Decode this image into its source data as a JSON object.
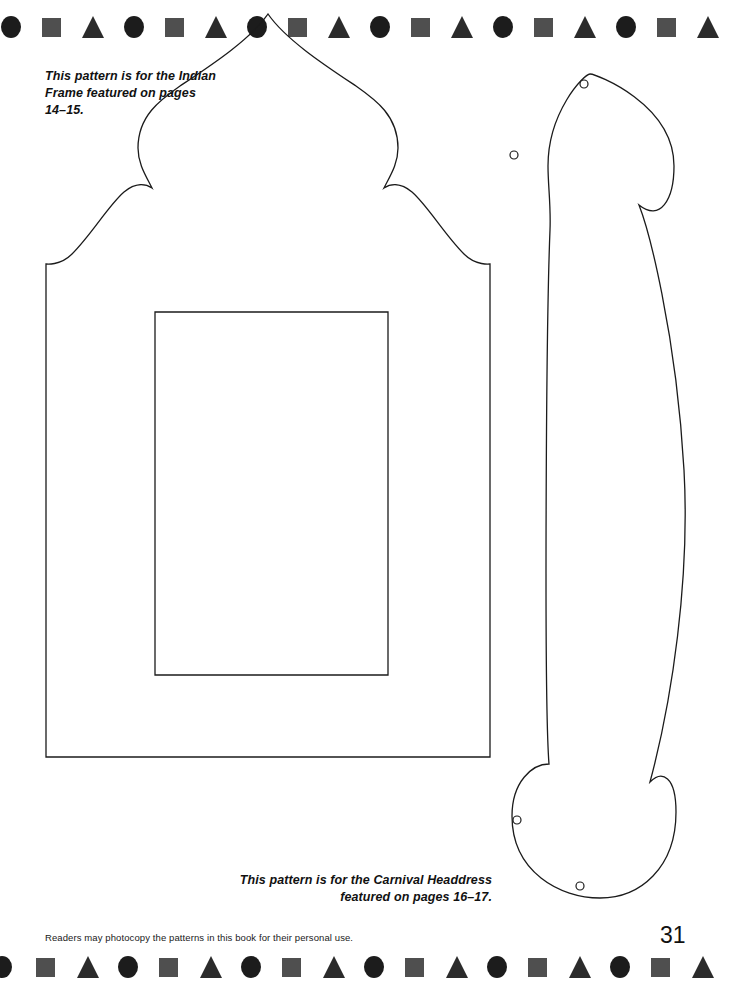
{
  "page": {
    "number": "31",
    "background_color": "#ffffff",
    "ink_color": "#1b1b1b",
    "width": 736,
    "height": 982
  },
  "captions": {
    "indian_frame": "This pattern is for the Indian\nFrame featured on pages\n14–15.",
    "carnival_headdress": "This pattern is for the Carnival Headdress\nfeatured on pages 16–17."
  },
  "footer": {
    "note": "Readers may photocopy the patterns in this book for their personal use."
  },
  "border": {
    "sequence": [
      "circle",
      "square",
      "triangle"
    ],
    "repeat_count": 18,
    "spacing_px": 41,
    "colors": {
      "circle": "#1c1c1c",
      "square": "#4f4f4f",
      "triangle": "#2b2b2b"
    }
  },
  "patterns": [
    {
      "id": "indian-frame",
      "name": "Indian Frame pattern outline",
      "description": "Ogee / onion-dome arch frame with rectangular aperture",
      "has_inner_window": true
    },
    {
      "id": "carnival-headdress",
      "name": "Carnival Headdress pattern outline",
      "description": "Elongated band with circular discs at each end",
      "punch_holes": 4
    }
  ]
}
